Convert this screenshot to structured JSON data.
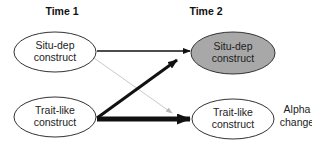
{
  "headers": {
    "time1": "Time 1",
    "time2": "Time 2"
  },
  "nodes": {
    "t1_situ": {
      "line1": "Situ-dep",
      "line2": "construct",
      "fill": "#ffffff"
    },
    "t2_situ": {
      "line1": "Situ-dep",
      "line2": "construct",
      "fill": "#a8a8a8"
    },
    "t1_trait": {
      "line1": "Trait-like",
      "line2": "construct",
      "fill": "#ffffff"
    },
    "t2_trait": {
      "line1": "Trait-like",
      "line2": "construct",
      "fill": "#ffffff"
    }
  },
  "annotation": {
    "line1": "Alpha",
    "line2": "change"
  },
  "edges": [
    {
      "from": "t1_situ",
      "to": "t2_situ",
      "weight": "thin",
      "color": "#111111"
    },
    {
      "from": "t1_situ",
      "to": "t2_trait",
      "weight": "hairline",
      "color": "#bbbbbb"
    },
    {
      "from": "t1_trait",
      "to": "t2_situ",
      "weight": "thick",
      "color": "#111111"
    },
    {
      "from": "t1_trait",
      "to": "t2_trait",
      "weight": "very-thick",
      "color": "#111111"
    }
  ]
}
